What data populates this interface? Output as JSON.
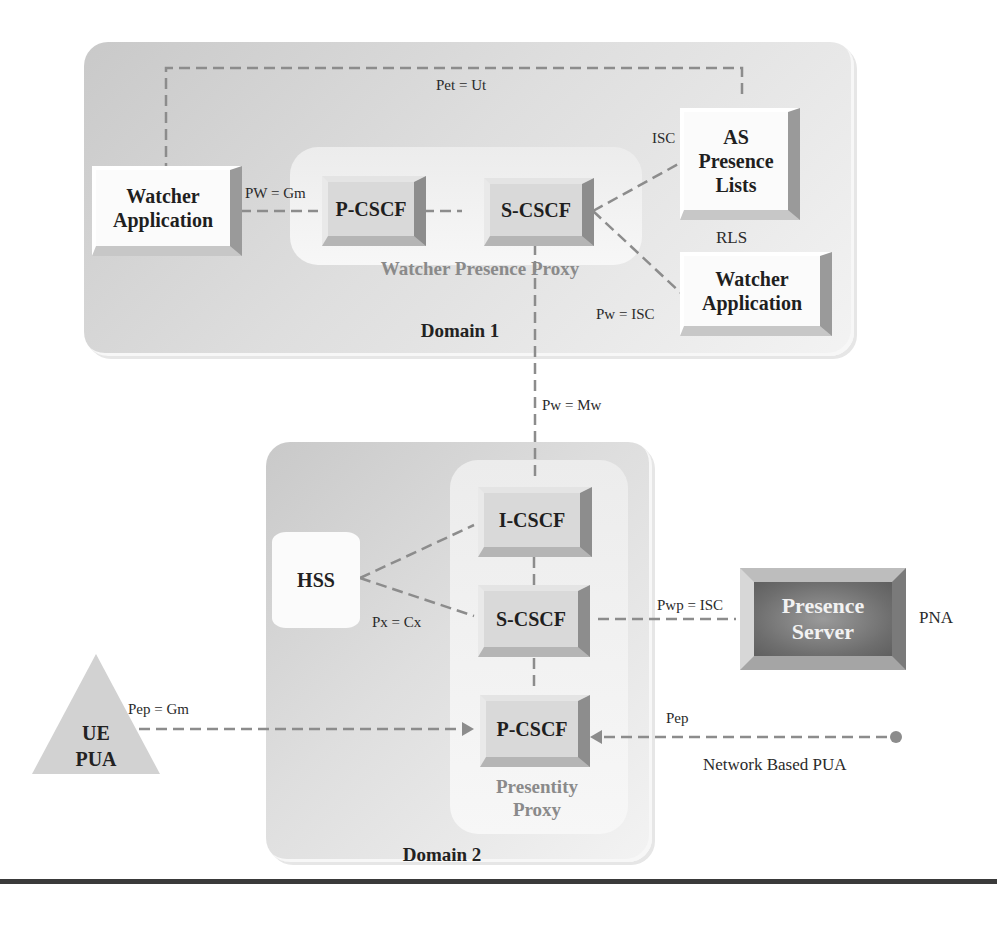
{
  "domains": {
    "domain1": {
      "label": "Domain 1"
    },
    "domain2": {
      "label": "Domain 2"
    }
  },
  "proxies": {
    "watcher_presence_proxy": {
      "label": "Watcher Presence Proxy"
    },
    "presentity_proxy": {
      "line1": "Presentity",
      "line2": "Proxy"
    }
  },
  "nodes": {
    "watcher_app_left": {
      "line1": "Watcher",
      "line2": "Application"
    },
    "p_cscf_d1": {
      "label": "P-CSCF"
    },
    "s_cscf_d1": {
      "label": "S-CSCF"
    },
    "as_presence_lists": {
      "line1": "AS",
      "line2": "Presence",
      "line3": "Lists"
    },
    "watcher_app_right": {
      "line1": "Watcher",
      "line2": "Application"
    },
    "i_cscf_d2": {
      "label": "I-CSCF"
    },
    "s_cscf_d2": {
      "label": "S-CSCF"
    },
    "p_cscf_d2": {
      "label": "P-CSCF"
    },
    "hss": {
      "label": "HSS"
    },
    "presence_server": {
      "line1": "Presence",
      "line2": "Server"
    },
    "ue_pua": {
      "line1": "UE",
      "line2": "PUA"
    }
  },
  "labels": {
    "rls": "RLS",
    "pna": "PNA",
    "network_based_pua": "Network Based PUA"
  },
  "interfaces": {
    "pet_ut": "Pet = Ut",
    "pw_gm": "PW = Gm",
    "isc": "ISC",
    "pw_isc": "Pw = ISC",
    "pw_mw": "Pw = Mw",
    "px_cx": "Px = Cx",
    "pwp_isc": "Pwp = ISC",
    "pep_gm": "Pep = Gm",
    "pep": "Pep"
  },
  "colors": {
    "line": "#8c8c8c",
    "domain_bg": "#d6d6d6",
    "proxy_bg": "#f2f2f2",
    "presence_server": "#767676",
    "rule": "#3a3a3a"
  }
}
